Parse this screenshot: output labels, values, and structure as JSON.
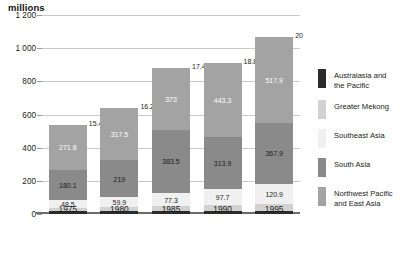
{
  "chart_data": {
    "type": "bar",
    "subtype": "stacked",
    "title": "",
    "ylabel": "millions",
    "xlabel": "",
    "ylim": [
      0,
      1200
    ],
    "yticks": [
      "0",
      "200",
      "400",
      "600",
      "800",
      "1 000",
      "1 200"
    ],
    "ytick_values": [
      0,
      200,
      400,
      600,
      800,
      1000,
      1200
    ],
    "grid": true,
    "legend_position": "right",
    "categories": [
      "1975",
      "1980",
      "1985",
      "1990",
      "1995"
    ],
    "series": [
      {
        "name": "Northwest Pacific and East Asia",
        "color": "#a3a3a3",
        "values": [
          271.8,
          317.5,
          373,
          443.3,
          517.9
        ],
        "labels": [
          "271.8",
          "317.5",
          "373",
          "443.3",
          "517.9"
        ]
      },
      {
        "name": "South Asia",
        "color": "#8a8a8a",
        "values": [
          180.1,
          219,
          383.5,
          313.9,
          367.9
        ],
        "labels": [
          "180.1",
          "219",
          "383.5",
          "313.9",
          "367.9"
        ]
      },
      {
        "name": "Southeast Asia",
        "color": "#f0f0f0",
        "values": [
          48.5,
          59.9,
          77.3,
          97.7,
          120.9
        ],
        "labels": [
          "48.5",
          "59.9",
          "77.3",
          "97.7",
          "120.9"
        ]
      },
      {
        "name": "Greater Mekong",
        "color": "#d2d2d2",
        "values": [
          23.6,
          27.8,
          31.5,
          36,
          40.7
        ],
        "labels": [
          "23.6",
          "27.8",
          "31.5",
          "36",
          "40.7"
        ]
      },
      {
        "name": "Australasia and the Pacific",
        "color": "#2b2b2b",
        "values": [
          15.4,
          16.2,
          17.4,
          18.8,
          20
        ],
        "labels": [
          "15.4",
          "16.2",
          "17.4",
          "18.8",
          "20"
        ]
      }
    ]
  },
  "legend": {
    "items": [
      {
        "label": "Australasia and the Pacific",
        "color": "#2b2b2b"
      },
      {
        "label": "Greater Mekong",
        "color": "#d2d2d2"
      },
      {
        "label": "Southeast Asia",
        "color": "#f0f0f0"
      },
      {
        "label": "South Asia",
        "color": "#8a8a8a"
      },
      {
        "label": "Northwest Pacific and East Asia",
        "color": "#a3a3a3"
      }
    ]
  }
}
